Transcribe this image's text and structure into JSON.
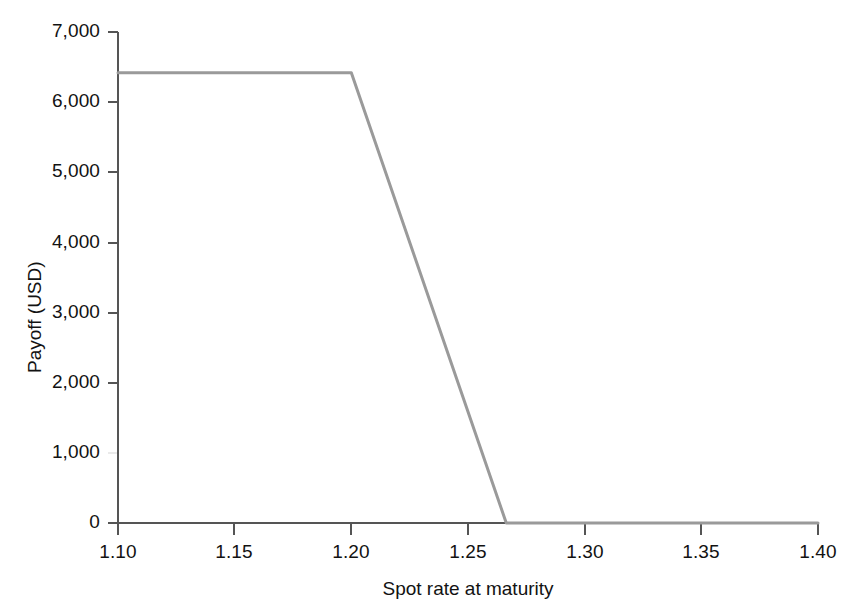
{
  "chart_data": {
    "type": "line",
    "title": "",
    "xlabel": "Spot rate at maturity",
    "ylabel": "Payoff (USD)",
    "xlim": [
      1.1,
      1.4
    ],
    "ylim": [
      0,
      7000
    ],
    "xticks": [
      "1.10",
      "1.15",
      "1.20",
      "1.25",
      "1.30",
      "1.35",
      "1.40"
    ],
    "xtick_values": [
      1.1,
      1.15,
      1.2,
      1.25,
      1.3,
      1.35,
      1.4
    ],
    "yticks": [
      "0",
      "1,000",
      "2,000",
      "3,000",
      "4,000",
      "5,000",
      "6,000",
      "7,000"
    ],
    "ytick_values": [
      0,
      1000,
      2000,
      3000,
      4000,
      5000,
      6000,
      7000
    ],
    "grid": false,
    "legend": null,
    "series": [
      {
        "name": "Payoff",
        "color": "#9a9a9a",
        "x": [
          1.1,
          1.2,
          1.2664,
          1.4
        ],
        "values": [
          6420,
          6420,
          0,
          0
        ]
      }
    ],
    "annotations": []
  },
  "axis": {
    "line_color": "#555555",
    "tick_color": "#555555",
    "text_color": "#121212"
  }
}
